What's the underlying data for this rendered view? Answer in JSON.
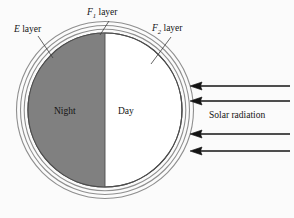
{
  "figure": {
    "background_color": "#fbfbfb"
  },
  "labels": {
    "e_layer": {
      "italic_prefix": "E",
      "text": " layer",
      "full": "E layer"
    },
    "f1_layer": {
      "italic_prefix": "F",
      "subscript": "1",
      "text": " layer",
      "full": "F1 layer"
    },
    "f2_layer": {
      "italic_prefix": "F",
      "subscript": "2",
      "text": " layer",
      "full": "F2 layer"
    },
    "night": "Night",
    "day": "Day",
    "solar_radiation": "Solar radiation"
  },
  "colors": {
    "night_fill": "#808080",
    "day_fill": "#ffffff",
    "outline": "#4d4d4d",
    "ring_stroke": "#8c8c8c",
    "arrow": "#141414",
    "text": "#141414",
    "background": "#fbfbfb"
  },
  "geometry": {
    "circle_center_x": 105,
    "circle_center_y": 110,
    "circle_radius": 77,
    "ring_radii": [
      81,
      85,
      89
    ],
    "terminator_x": 105
  },
  "arrows": {
    "count": 4,
    "direction": "left",
    "rows": [
      {
        "y": 86,
        "x_start": 290,
        "x_end": 192
      },
      {
        "y": 101,
        "x_start": 290,
        "x_end": 192
      },
      {
        "y": 134,
        "x_start": 290,
        "x_end": 192
      },
      {
        "y": 151,
        "x_start": 290,
        "x_end": 192
      }
    ]
  },
  "leader_lines": [
    {
      "name": "e-layer-leader",
      "x1": 38,
      "y1": 36,
      "x2": 52,
      "y2": 57
    },
    {
      "name": "f1-layer-leader",
      "x1": 108,
      "y1": 22,
      "x2": 100,
      "y2": 36
    },
    {
      "name": "f2-layer-leader",
      "x1": 170,
      "y1": 38,
      "x2": 152,
      "y2": 63
    }
  ]
}
